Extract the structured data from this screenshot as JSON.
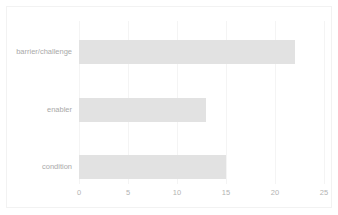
{
  "chart_data": {
    "type": "bar",
    "orientation": "horizontal",
    "title": "",
    "xlabel": "",
    "ylabel": "",
    "categories": [
      "barrier/challenge",
      "enabler",
      "condition"
    ],
    "values": [
      22,
      13,
      15
    ],
    "xlim": [
      0,
      25
    ],
    "xticks": [
      0,
      5,
      10,
      15,
      20,
      25
    ],
    "xtick_labels": [
      "0",
      "5",
      "10",
      "15",
      "20",
      "25"
    ],
    "grid": "vertical",
    "legend": "none",
    "bar_color": "#e2e2e2",
    "gridline_color": "#f4f4f4",
    "label_color": "#a9a9a9",
    "tick_color": "#b3b3b3",
    "border_color": "#f2f2f2",
    "background_color": "#ffffff"
  }
}
